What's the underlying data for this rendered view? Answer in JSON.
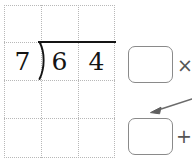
{
  "worksheet": {
    "type": "long-division-worksheet",
    "background_color": "#ffffff",
    "grid": {
      "line_color": "#b8b8b8",
      "columns": 3,
      "rows": 4,
      "cell_size_px": 37,
      "left_px": 4,
      "top_px": 5
    },
    "division": {
      "divisor": "7",
      "dividend_digits": [
        "6",
        "4"
      ],
      "dividend": "64",
      "bracket_symbol": "long-division-bracket",
      "ink_color": "#141414"
    },
    "answer_boxes": [
      {
        "id": "box-top",
        "value": "",
        "placeholder": "",
        "operator_after": "×",
        "operator_name": "multiplication-sign"
      },
      {
        "id": "box-bottom",
        "value": "",
        "placeholder": "",
        "operator_after": "+",
        "operator_name": "plus-sign",
        "has_incoming_arrow": true
      }
    ],
    "annotation_arrow": {
      "name": "pointer-arrow",
      "color": "#6b6b6b",
      "points_to": "box-bottom",
      "direction": "from-upper-right-to-lower-left"
    },
    "box_border_color": "#8a8a8a",
    "operator_color": "#555555"
  }
}
